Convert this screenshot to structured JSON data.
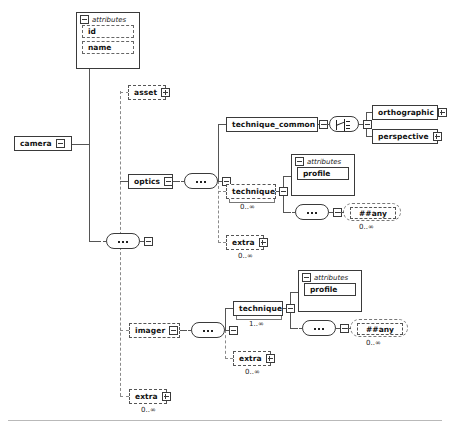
{
  "diagram": {
    "type": "xsd-element-tree",
    "root": "camera",
    "colors": {
      "line": "#555555",
      "dashed_line": "#8a8a8a",
      "node_border": "#3a3a3a",
      "background": "#ffffff",
      "rule": "#b9b9b9"
    }
  },
  "nodes": {
    "camera": {
      "label": "camera",
      "style": "solid",
      "icon": "collapse-box"
    },
    "attributes_camera": {
      "header": "attributes",
      "items": [
        {
          "label": "id",
          "style": "dashed"
        },
        {
          "label": "name",
          "style": "dashed"
        }
      ]
    },
    "asset": {
      "label": "asset",
      "style": "dashed",
      "icon": "expand-box"
    },
    "optics": {
      "label": "optics",
      "style": "solid",
      "icon": "collapse-box"
    },
    "technique_common": {
      "label": "technique_common",
      "style": "solid",
      "icon": "collapse-box"
    },
    "orthographic": {
      "label": "orthographic",
      "style": "solid",
      "icon": "expand-box"
    },
    "perspective": {
      "label": "perspective",
      "style": "solid",
      "icon": "expand-box"
    },
    "technique_optics": {
      "label": "technique",
      "style": "dashed",
      "icon": "collapse-box",
      "cardinality": "0..∞"
    },
    "attributes_technique_optics": {
      "header": "attributes",
      "items": [
        {
          "label": "profile",
          "style": "solid"
        }
      ]
    },
    "any_optics": {
      "label": "##any",
      "cardinality": "0..∞"
    },
    "extra_optics": {
      "label": "extra",
      "style": "dashed",
      "icon": "expand-box",
      "cardinality": "0..∞"
    },
    "imager": {
      "label": "imager",
      "style": "dashed",
      "icon": "collapse-box"
    },
    "technique_imager": {
      "label": "technique",
      "style": "solid",
      "icon": "collapse-box",
      "cardinality": "1..∞"
    },
    "attributes_technique_imager": {
      "header": "attributes",
      "items": [
        {
          "label": "profile",
          "style": "solid"
        }
      ]
    },
    "any_imager": {
      "label": "##any",
      "cardinality": "0..∞"
    },
    "extra_imager": {
      "label": "extra",
      "style": "dashed",
      "icon": "expand-box",
      "cardinality": "0..∞"
    },
    "extra_camera": {
      "label": "extra",
      "style": "dashed",
      "icon": "expand-box",
      "cardinality": "0..∞"
    }
  },
  "compositors": {
    "sequence_camera": {
      "kind": "sequence"
    },
    "sequence_optics": {
      "kind": "sequence"
    },
    "choice_technique_common": {
      "kind": "choice"
    },
    "sequence_any_optics": {
      "kind": "sequence"
    },
    "sequence_imager": {
      "kind": "sequence"
    },
    "sequence_any_imager": {
      "kind": "sequence"
    }
  }
}
